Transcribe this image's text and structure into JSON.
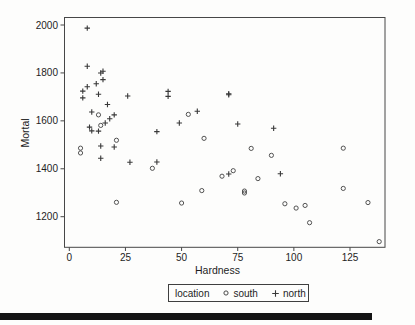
{
  "legend": {
    "title": "location",
    "items": [
      {
        "marker": "circle",
        "label": "south"
      },
      {
        "marker": "plus",
        "label": "north"
      }
    ]
  },
  "colors": {
    "axis": "#474747",
    "text": "#1e1e1e",
    "marker_south": "#4a4a4a",
    "marker_north": "#383838",
    "bottom_rule": "#141414"
  },
  "chart_data": {
    "type": "scatter",
    "xlabel": "Hardness",
    "ylabel": "Mortal",
    "x_ticks": [
      0,
      25,
      50,
      75,
      100,
      125
    ],
    "y_ticks": [
      2000,
      1800,
      1600,
      1400,
      1200
    ],
    "xlim": [
      0,
      140
    ],
    "ylim": [
      1075,
      2030
    ],
    "grid": false,
    "legend_position": "bottom",
    "series": [
      {
        "name": "south",
        "marker": "circle",
        "points": [
          [
            5,
            1486
          ],
          [
            5,
            1466
          ],
          [
            13,
            1625
          ],
          [
            14,
            1581
          ],
          [
            21,
            1519
          ],
          [
            21,
            1260
          ],
          [
            37,
            1402
          ],
          [
            50,
            1257
          ],
          [
            53,
            1627
          ],
          [
            59,
            1309
          ],
          [
            60,
            1527
          ],
          [
            68,
            1369
          ],
          [
            73,
            1392
          ],
          [
            78,
            1307
          ],
          [
            78,
            1299
          ],
          [
            81,
            1485
          ],
          [
            84,
            1359
          ],
          [
            90,
            1456
          ],
          [
            96,
            1254
          ],
          [
            101,
            1236
          ],
          [
            105,
            1247
          ],
          [
            107,
            1175
          ],
          [
            122,
            1486
          ],
          [
            122,
            1318
          ],
          [
            133,
            1259
          ],
          [
            138,
            1096
          ]
        ]
      },
      {
        "name": "north",
        "marker": "plus",
        "points": [
          [
            8,
            1987
          ],
          [
            8,
            1828
          ],
          [
            14,
            1800
          ],
          [
            15,
            1807
          ],
          [
            15,
            1772
          ],
          [
            12,
            1755
          ],
          [
            8,
            1742
          ],
          [
            6,
            1724
          ],
          [
            6,
            1696
          ],
          [
            13,
            1711
          ],
          [
            17,
            1668
          ],
          [
            10,
            1637
          ],
          [
            26,
            1704
          ],
          [
            44,
            1723
          ],
          [
            44,
            1702
          ],
          [
            71,
            1713
          ],
          [
            71,
            1709
          ],
          [
            16,
            1591
          ],
          [
            18,
            1609
          ],
          [
            20,
            1625
          ],
          [
            9,
            1574
          ],
          [
            10,
            1558
          ],
          [
            13,
            1557
          ],
          [
            39,
            1555
          ],
          [
            49,
            1591
          ],
          [
            57,
            1640
          ],
          [
            75,
            1587
          ],
          [
            91,
            1569
          ],
          [
            14,
            1495
          ],
          [
            20,
            1491
          ],
          [
            14,
            1444
          ],
          [
            27,
            1427
          ],
          [
            39,
            1428
          ],
          [
            71,
            1378
          ],
          [
            94,
            1379
          ]
        ]
      }
    ]
  }
}
